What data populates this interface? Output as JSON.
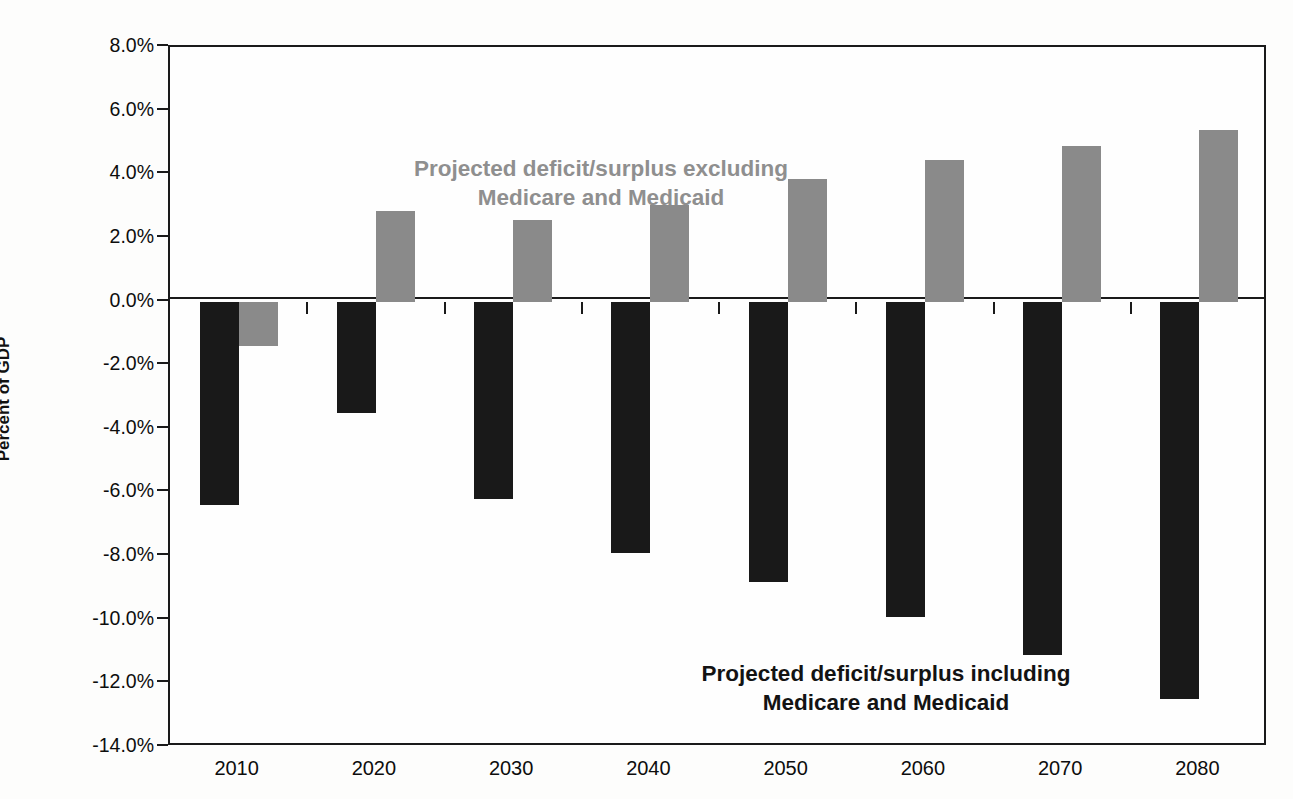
{
  "chart_data": {
    "type": "bar",
    "title": "",
    "subtitle": "",
    "xlabel": "",
    "ylabel": "Percent of GDP",
    "categories": [
      "2010",
      "2020",
      "2030",
      "2040",
      "2050",
      "2060",
      "2070",
      "2080"
    ],
    "series": [
      {
        "name": "Projected deficit/surplus including Medicare and Medicaid",
        "color": "#191919",
        "values": [
          -6.4,
          -3.5,
          -6.2,
          -7.9,
          -8.8,
          -9.9,
          -11.1,
          -12.5
        ]
      },
      {
        "name": "Projected deficit/surplus excluding Medicare and Medicaid",
        "color": "#8a8a8a",
        "values": [
          -1.4,
          2.85,
          2.55,
          3.05,
          3.85,
          4.45,
          4.9,
          5.4
        ]
      }
    ],
    "ylim": [
      -14.0,
      8.0
    ],
    "ytick_labels": [
      "8.0%",
      "6.0%",
      "4.0%",
      "2.0%",
      "0.0%",
      "-2.0%",
      "-4.0%",
      "-6.0%",
      "-8.0%",
      "-10.0%",
      "-12.0%",
      "-14.0%"
    ],
    "ytick_values": [
      8.0,
      6.0,
      4.0,
      2.0,
      0.0,
      -2.0,
      -4.0,
      -6.0,
      -8.0,
      -10.0,
      -12.0,
      -14.0
    ],
    "grid": false,
    "legend_position": "inline-annotations",
    "annotations": [
      {
        "id": "excluding",
        "text": "Projected deficit/surplus excluding\nMedicare and Medicaid",
        "color": "#8f8f8f"
      },
      {
        "id": "including",
        "text": "Projected deficit/surplus including\nMedicare and Medicaid",
        "color": "#131313"
      }
    ]
  },
  "axis": {
    "y_title": "Percent of GDP"
  },
  "colors": {
    "including_series": "#191919",
    "excluding_series": "#8a8a8a",
    "axis": "#1a1a1a",
    "background": "#fdfdfc"
  }
}
